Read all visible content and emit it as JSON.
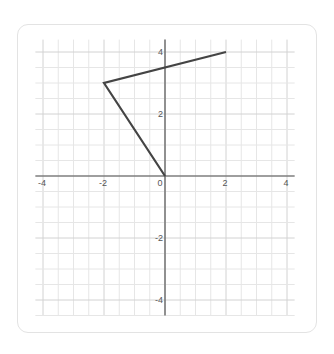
{
  "chart_data": {
    "type": "line",
    "title": "",
    "xlabel": "",
    "ylabel": "",
    "xlim": [
      -4.25,
      4.25
    ],
    "ylim": [
      -4.5,
      4.4
    ],
    "grid": true,
    "minor_grid_step": 0.5,
    "x_ticks": [
      -4,
      -2,
      0,
      2,
      4
    ],
    "y_ticks": [
      -4,
      -2,
      2,
      4
    ],
    "x_tick_labels": [
      "-4",
      "-2",
      "0",
      "2",
      "4"
    ],
    "y_tick_labels": [
      "-4",
      "-2",
      "2",
      "4"
    ],
    "series": [
      {
        "name": "polyline",
        "color": "#444444",
        "points": [
          [
            2,
            4
          ],
          [
            -2,
            3
          ],
          [
            0,
            0
          ]
        ]
      }
    ]
  },
  "colors": {
    "grid_minor": "#e6e6e6",
    "grid_major": "#d2d2d2",
    "axis": "#555555",
    "line": "#444444",
    "card_border": "#e3e3e3"
  }
}
